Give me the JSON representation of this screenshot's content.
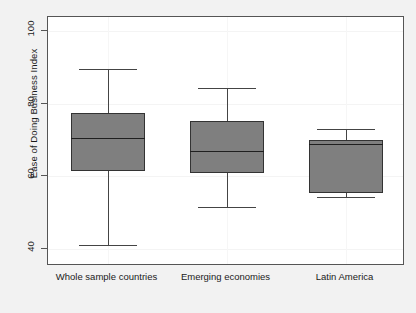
{
  "chart_data": {
    "type": "box",
    "title": "",
    "xlabel": "",
    "ylabel": "Ease of Doing Business Index",
    "ylim": [
      33,
      103
    ],
    "yticks": [
      40,
      60,
      80,
      100
    ],
    "ytick_labels": [
      "40",
      "60",
      "80",
      "100"
    ],
    "grid": true,
    "legend": "none",
    "categories": [
      "Whole sample countries",
      "Emerging economies",
      "Latin America"
    ],
    "boxes": [
      {
        "category": "Whole sample countries",
        "whisker_low": 41.0,
        "q1": 61.5,
        "median": 70.6,
        "q3": 77.5,
        "whisker_high": 89.6,
        "outliers": [
          34.0
        ]
      },
      {
        "category": "Emerging economies",
        "whisker_low": 51.6,
        "q1": 61.0,
        "median": 67.0,
        "q3": 75.3,
        "whisker_high": 84.4,
        "outliers": []
      },
      {
        "category": "Latin America",
        "whisker_low": 54.4,
        "q1": 55.5,
        "median": 68.9,
        "q3": 70.0,
        "whisker_high": 73.1,
        "outliers": []
      }
    ],
    "colors": {
      "box_fill": "#7f7f7f",
      "box_edge": "#333333",
      "median": "#1f1f1f",
      "whisker": "#444444",
      "outlier": "#111111",
      "plot_background": "#ffffff",
      "figure_background": "#f2f2f2",
      "frame": "#555555",
      "grid": "#f4f4f4",
      "text": "#1a1a1a"
    }
  }
}
